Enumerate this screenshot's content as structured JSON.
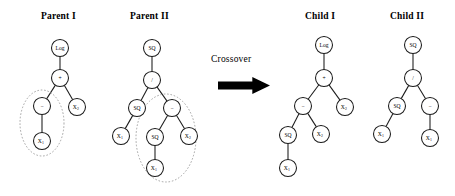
{
  "figure": {
    "type": "genetic-programming-crossover",
    "operation_label": "Crossover",
    "panels": [
      {
        "id": "parent1",
        "title": "Parent I"
      },
      {
        "id": "parent2",
        "title": "Parent II"
      },
      {
        "id": "child1",
        "title": "Child I"
      },
      {
        "id": "child2",
        "title": "Child II"
      }
    ]
  },
  "trees": {
    "parent1": {
      "title": "Parent I",
      "nodes": [
        {
          "id": "p1n0",
          "label": "Log",
          "sub": "",
          "x": 60,
          "y": 48,
          "r": 8.5
        },
        {
          "id": "p1n1",
          "label": "+",
          "sub": "",
          "x": 60,
          "y": 78,
          "r": 8.5
        },
        {
          "id": "p1n2",
          "label": "−",
          "sub": "",
          "x": 42,
          "y": 106,
          "r": 8.5
        },
        {
          "id": "p1n3",
          "label": "X",
          "sub": "2",
          "x": 77,
          "y": 107,
          "r": 8.5
        },
        {
          "id": "p1n4",
          "label": "X",
          "sub": "1",
          "x": 42,
          "y": 141,
          "r": 8.5
        }
      ],
      "edges": [
        {
          "from": "p1n0",
          "to": "p1n1"
        },
        {
          "from": "p1n1",
          "to": "p1n2"
        },
        {
          "from": "p1n1",
          "to": "p1n3"
        },
        {
          "from": "p1n2",
          "to": "p1n4"
        }
      ],
      "highlight": {
        "cx": 42,
        "cy": 123,
        "rx": 22,
        "ry": 33,
        "label": "crossover-subtree-parent1"
      }
    },
    "parent2": {
      "title": "Parent II",
      "nodes": [
        {
          "id": "p2n0",
          "label": "SQ",
          "sub": "",
          "x": 152,
          "y": 48,
          "r": 8.5
        },
        {
          "id": "p2n1",
          "label": "/",
          "sub": "",
          "x": 152,
          "y": 80,
          "r": 8.5
        },
        {
          "id": "p2n2",
          "label": "SQ",
          "sub": "",
          "x": 137,
          "y": 108,
          "r": 8.5
        },
        {
          "id": "p2n3",
          "label": "−",
          "sub": "",
          "x": 172,
          "y": 108,
          "r": 8.5
        },
        {
          "id": "p2n4",
          "label": "X",
          "sub": "1",
          "x": 121,
          "y": 136,
          "r": 8.5
        },
        {
          "id": "p2n5",
          "label": "SQ",
          "sub": "",
          "x": 155,
          "y": 137,
          "r": 8.5
        },
        {
          "id": "p2n6",
          "label": "X",
          "sub": "2",
          "x": 189,
          "y": 136,
          "r": 8.5
        },
        {
          "id": "p2n7",
          "label": "X",
          "sub": "1",
          "x": 155,
          "y": 168,
          "r": 8.5
        }
      ],
      "edges": [
        {
          "from": "p2n0",
          "to": "p2n1"
        },
        {
          "from": "p2n1",
          "to": "p2n2"
        },
        {
          "from": "p2n1",
          "to": "p2n3"
        },
        {
          "from": "p2n2",
          "to": "p2n4"
        },
        {
          "from": "p2n3",
          "to": "p2n5"
        },
        {
          "from": "p2n3",
          "to": "p2n6"
        },
        {
          "from": "p2n5",
          "to": "p2n7"
        }
      ],
      "highlight": {
        "cx": 166,
        "cy": 138,
        "rx": 30,
        "ry": 44,
        "label": "crossover-subtree-parent2"
      }
    },
    "child1": {
      "title": "Child I",
      "nodes": [
        {
          "id": "c1n0",
          "label": "Log",
          "sub": "",
          "x": 324,
          "y": 45,
          "r": 8.5
        },
        {
          "id": "c1n1",
          "label": "+",
          "sub": "",
          "x": 324,
          "y": 78,
          "r": 8.5
        },
        {
          "id": "c1n2",
          "label": "−",
          "sub": "",
          "x": 303,
          "y": 106,
          "r": 8.5
        },
        {
          "id": "c1n3",
          "label": "X",
          "sub": "2",
          "x": 345,
          "y": 107,
          "r": 8.5
        },
        {
          "id": "c1n4",
          "label": "SQ",
          "sub": "",
          "x": 288,
          "y": 135,
          "r": 8.5
        },
        {
          "id": "c1n5",
          "label": "X",
          "sub": "2",
          "x": 321,
          "y": 134,
          "r": 8.5
        },
        {
          "id": "c1n6",
          "label": "X",
          "sub": "1",
          "x": 288,
          "y": 168,
          "r": 8.5
        }
      ],
      "edges": [
        {
          "from": "c1n0",
          "to": "c1n1"
        },
        {
          "from": "c1n1",
          "to": "c1n2"
        },
        {
          "from": "c1n1",
          "to": "c1n3"
        },
        {
          "from": "c1n2",
          "to": "c1n4"
        },
        {
          "from": "c1n2",
          "to": "c1n5"
        },
        {
          "from": "c1n4",
          "to": "c1n6"
        }
      ],
      "highlight": null
    },
    "child2": {
      "title": "Child II",
      "nodes": [
        {
          "id": "c2n0",
          "label": "SQ",
          "sub": "",
          "x": 413,
          "y": 45,
          "r": 8.5
        },
        {
          "id": "c2n1",
          "label": "/",
          "sub": "",
          "x": 413,
          "y": 78,
          "r": 8.5
        },
        {
          "id": "c2n2",
          "label": "SQ",
          "sub": "",
          "x": 397,
          "y": 106,
          "r": 8.5
        },
        {
          "id": "c2n3",
          "label": "−",
          "sub": "",
          "x": 430,
          "y": 106,
          "r": 8.5
        },
        {
          "id": "c2n4",
          "label": "X",
          "sub": "1",
          "x": 382,
          "y": 134,
          "r": 8.5
        },
        {
          "id": "c2n5",
          "label": "X",
          "sub": "1",
          "x": 430,
          "y": 138,
          "r": 8.5
        }
      ],
      "edges": [
        {
          "from": "c2n0",
          "to": "c2n1"
        },
        {
          "from": "c2n1",
          "to": "c2n2"
        },
        {
          "from": "c2n1",
          "to": "c2n3"
        },
        {
          "from": "c2n2",
          "to": "c2n4"
        },
        {
          "from": "c2n3",
          "to": "c2n5"
        }
      ],
      "highlight": null
    }
  },
  "titles": {
    "parent1": {
      "text": "Parent I",
      "x": 41,
      "y": 11
    },
    "parent2": {
      "text": "Parent II",
      "x": 130,
      "y": 11
    },
    "child1": {
      "text": "Child I",
      "x": 305,
      "y": 11
    },
    "child2": {
      "text": "Child II",
      "x": 390,
      "y": 11
    }
  },
  "crossover": {
    "label": "Crossover",
    "label_x": 211,
    "label_y": 54,
    "arrow": {
      "x": 218,
      "y": 77,
      "w": 52,
      "h": 17
    }
  },
  "colors": {
    "stroke": "#1a1a1a",
    "node_fill": "#ffffff",
    "highlight_stroke": "#9a9a9a",
    "arrow_fill": "#000000",
    "background": "#ffffff",
    "text": "#000000"
  }
}
